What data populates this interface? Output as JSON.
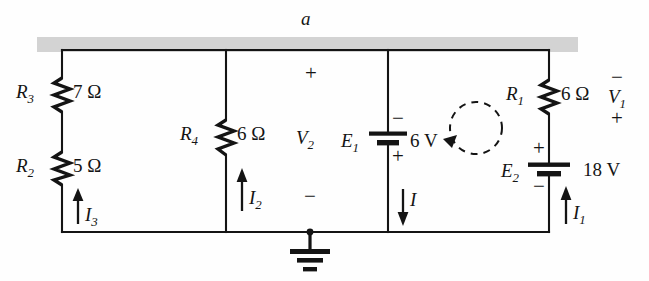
{
  "diagram": {
    "title_node": "a",
    "bus_bar_name": "node-a-bus",
    "branches": [
      {
        "id": "branch-left",
        "components": [
          {
            "ref": "R",
            "sub": "3",
            "value": "7 Ω"
          },
          {
            "ref": "R",
            "sub": "2",
            "value": "5 Ω"
          }
        ],
        "current": {
          "ref": "I",
          "sub": "3",
          "direction": "up"
        }
      },
      {
        "id": "branch-r4",
        "components": [
          {
            "ref": "R",
            "sub": "4",
            "value": "6 Ω"
          }
        ],
        "current": {
          "ref": "I",
          "sub": "2",
          "direction": "up"
        },
        "voltage": {
          "ref": "V",
          "sub": "2",
          "top_sign": "+",
          "bottom_sign": "−"
        }
      },
      {
        "id": "branch-e1",
        "components": [
          {
            "ref": "E",
            "sub": "1",
            "value": "6 V",
            "top_sign": "−",
            "bottom_sign": "+"
          }
        ],
        "current": {
          "ref": "I",
          "sub": "",
          "direction": "down"
        }
      },
      {
        "id": "branch-right",
        "components": [
          {
            "ref": "R",
            "sub": "1",
            "value": "6 Ω"
          },
          {
            "ref": "E",
            "sub": "2",
            "value": "18 V",
            "top_sign": "+",
            "bottom_sign": "−"
          }
        ],
        "current": {
          "ref": "I",
          "sub": "1",
          "direction": "up"
        },
        "voltage": {
          "ref": "V",
          "sub": "1",
          "top_sign": "−",
          "bottom_sign": "+"
        }
      }
    ],
    "loop": {
      "name": "mesh-loop-arrow",
      "direction": "counterclockwise"
    },
    "ground": {
      "name": "ground-symbol"
    },
    "colors": {
      "wire": "#141414",
      "bus_fill": "#d2d2d2",
      "text": "#141414",
      "background": "#fefefe"
    },
    "labels": {
      "R3_ref": "R",
      "R3_sub": "3",
      "R3_val": "7 Ω",
      "R2_ref": "R",
      "R2_sub": "2",
      "R2_val": "5 Ω",
      "R4_ref": "R",
      "R4_sub": "4",
      "R4_val": "6 Ω",
      "R1_ref": "R",
      "R1_sub": "1",
      "R1_val": "6 Ω",
      "E1_ref": "E",
      "E1_sub": "1",
      "E1_val": "6 V",
      "E1_top": "−",
      "E1_bot": "+",
      "E2_ref": "E",
      "E2_sub": "2",
      "E2_val": "18 V",
      "E2_top": "+",
      "E2_bot": "−",
      "I3_ref": "I",
      "I3_sub": "3",
      "I2_ref": "I",
      "I2_sub": "2",
      "I1_ref": "I",
      "I1_sub": "1",
      "I_ref": "I",
      "V2_ref": "V",
      "V2_sub": "2",
      "V2_top": "+",
      "V2_bot": "−",
      "V1_ref": "V",
      "V1_sub": "1",
      "V1_top": "−",
      "V1_bot": "+",
      "node_a": "a"
    }
  }
}
